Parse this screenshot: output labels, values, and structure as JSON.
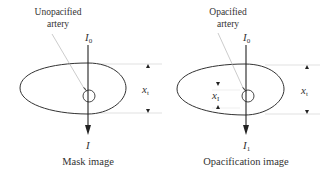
{
  "panels": [
    {
      "caption": "Mask image",
      "artery_label_line1": "Unopacified",
      "artery_label_line2": "artery",
      "incident_intensity": "I",
      "incident_sub": "0",
      "transmitted_intensity": "I",
      "transmitted_sub": "",
      "thickness_label": "x",
      "thickness_sub": "t"
    },
    {
      "caption": "Opacification image",
      "artery_label_line1": "Opacified",
      "artery_label_line2": "artery",
      "incident_intensity": "I",
      "incident_sub": "0",
      "transmitted_intensity": "I",
      "transmitted_sub": "1",
      "thickness_label": "x",
      "thickness_sub": "t",
      "iodine_label": "x",
      "iodine_sub": "I"
    }
  ],
  "colors": {
    "line": "#333333",
    "guide": "#cccccc",
    "leader": "#aaaaaa"
  }
}
